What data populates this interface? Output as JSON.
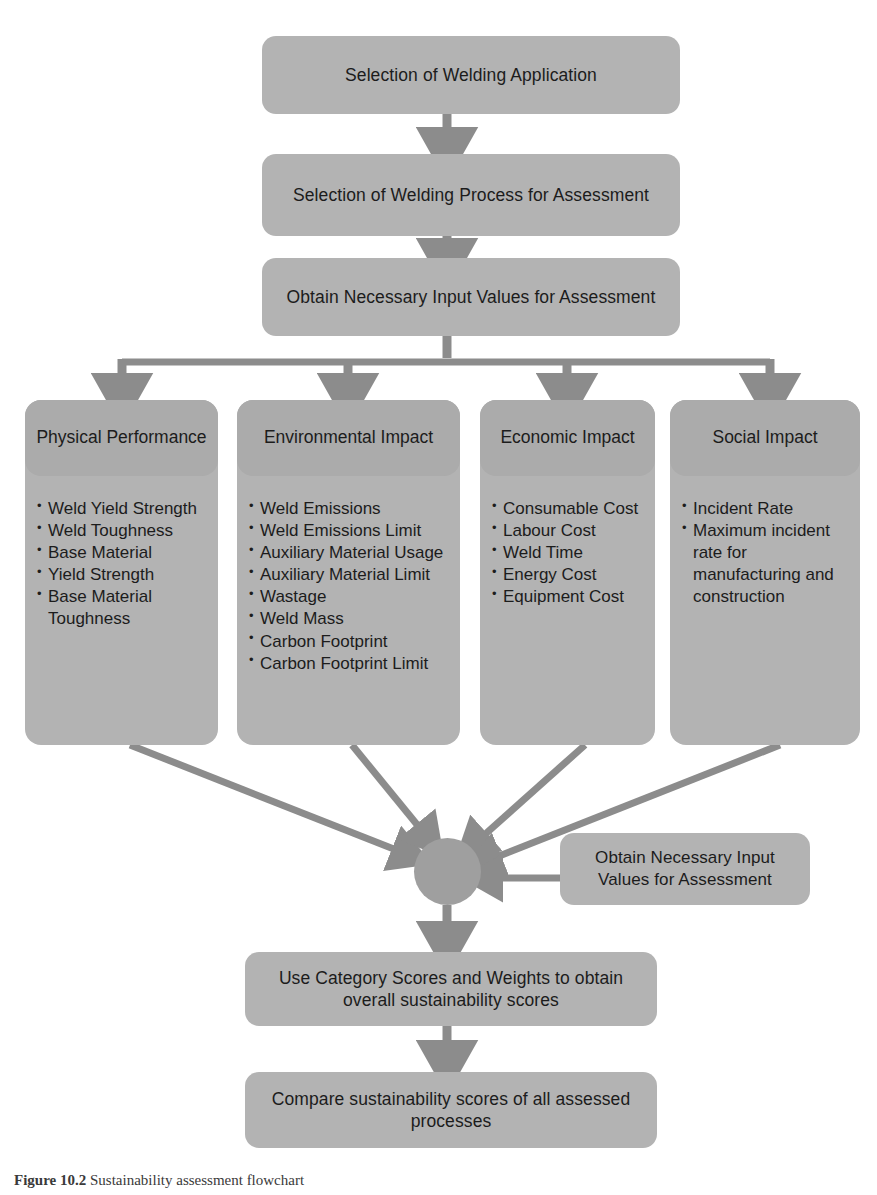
{
  "figure": {
    "caption_label": "Figure 10.2",
    "caption_text": "Sustainability assessment flowchart"
  },
  "colors": {
    "box_fill": "#b3b3b3",
    "panel_header_fill": "#ababab",
    "hub_fill": "#9f9f9f",
    "arrow": "#8c8c8c",
    "text": "#1c1c1c"
  },
  "flow": {
    "step_1": "Selection of Welding Application",
    "step_2": "Selection of Welding Process for Assessment",
    "step_3": "Obtain Necessary Input Values for Assessment",
    "side_input": "Obtain Necessary Input Values for Assessment",
    "step_4": "Use Category Scores and Weights to obtain overall sustainability scores",
    "step_5": "Compare sustainability scores of all assessed processes"
  },
  "categories": [
    {
      "title": "Physical Performance",
      "items": [
        "Weld Yield Strength",
        "Weld Toughness",
        "Base Material",
        "Yield Strength",
        "Base Material Toughness"
      ]
    },
    {
      "title": "Environmental Impact",
      "items": [
        "Weld Emissions",
        "Weld Emissions Limit",
        "Auxiliary Material Usage",
        "Auxiliary Material Limit",
        "Wastage",
        "Weld Mass",
        "Carbon Footprint",
        "Carbon Footprint Limit"
      ]
    },
    {
      "title": "Economic Impact",
      "items": [
        "Consumable Cost",
        "Labour Cost",
        "Weld Time",
        "Energy Cost",
        "Equipment Cost"
      ]
    },
    {
      "title": "Social Impact",
      "items": [
        "Incident Rate",
        "Maximum incident rate for manufacturing and construction"
      ]
    }
  ]
}
